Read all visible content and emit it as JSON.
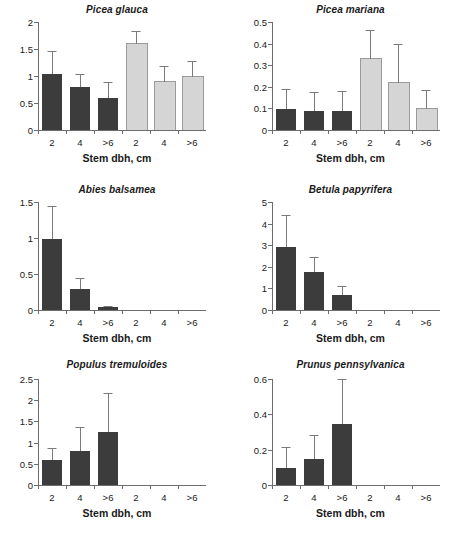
{
  "figure": {
    "xlabel": "Stem dbh, cm",
    "categories": [
      ">6",
      "4",
      "2"
    ],
    "caption_partial": "Results are presented by diameter (dbh) in three size classes. The dark bars are control plots and the light bars are treated plots."
  },
  "colors": {
    "dark_bar": "#3c3c3c",
    "light_bar": "#d5d5d5",
    "axis": "#6d6d6d",
    "error_bar": "#7a7a7a",
    "text": "#1a1a1a"
  },
  "chart_data": [
    {
      "type": "bar",
      "title": "Picea glauca",
      "xlabel": "Stem dbh, cm",
      "ylabel": "",
      "ylim": [
        0,
        2
      ],
      "yticks": [
        0,
        0.5,
        1,
        1.5,
        2
      ],
      "ytick_labels": [
        "0",
        "0.5",
        "1",
        "1.5",
        "2"
      ],
      "categories": [
        "2",
        "4",
        ">6",
        "2",
        "4",
        ">6"
      ],
      "groups": [
        "dark",
        "dark",
        "dark",
        "light",
        "light",
        "light"
      ],
      "values": [
        1.03,
        0.79,
        0.59,
        1.59,
        0.88,
        0.99
      ],
      "errors_upper": [
        1.46,
        1.03,
        0.89,
        1.84,
        1.18,
        1.28
      ],
      "grid": false,
      "legend": "none"
    },
    {
      "type": "bar",
      "title": "Picea mariana",
      "xlabel": "Stem dbh, cm",
      "ylabel": "",
      "ylim": [
        0,
        0.5
      ],
      "yticks": [
        0,
        0.1,
        0.2,
        0.3,
        0.4,
        0.5
      ],
      "ytick_labels": [
        "0",
        "0.1",
        "0.2",
        "0.3",
        "0.4",
        "0.5"
      ],
      "categories": [
        "2",
        "4",
        ">6",
        "2",
        "4",
        ">6"
      ],
      "groups": [
        "dark",
        "dark",
        "dark",
        "light",
        "light",
        "light"
      ],
      "values": [
        0.098,
        0.089,
        0.088,
        0.328,
        0.216,
        0.097
      ],
      "errors_upper": [
        0.188,
        0.178,
        0.182,
        0.462,
        0.399,
        0.185
      ],
      "grid": false,
      "legend": "none"
    },
    {
      "type": "bar",
      "title": "Abies balsamea",
      "xlabel": "Stem dbh, cm",
      "ylabel": "",
      "ylim": [
        0,
        1.5
      ],
      "yticks": [
        0,
        0.5,
        1,
        1.5
      ],
      "ytick_labels": [
        "0",
        "0.5",
        "1",
        "1.5"
      ],
      "categories": [
        "2",
        "4",
        ">6",
        "2",
        "4",
        ">6"
      ],
      "groups": [
        "dark",
        "dark",
        "dark",
        "light",
        "light",
        "light"
      ],
      "values": [
        0.99,
        0.29,
        0.035,
        0,
        0,
        0
      ],
      "errors_upper": [
        1.44,
        0.44,
        0.05,
        0,
        0,
        0
      ],
      "grid": false,
      "legend": "none"
    },
    {
      "type": "bar",
      "title": "Betula papyrifera",
      "xlabel": "Stem dbh, cm",
      "ylabel": "",
      "ylim": [
        0,
        5
      ],
      "yticks": [
        0,
        1,
        2,
        3,
        4,
        5
      ],
      "ytick_labels": [
        "0",
        "1",
        "2",
        "3",
        "4",
        "5"
      ],
      "categories": [
        "2",
        "4",
        ">6",
        "2",
        "4",
        ">6"
      ],
      "groups": [
        "dark",
        "dark",
        "dark",
        "light",
        "light",
        "light"
      ],
      "values": [
        2.93,
        1.78,
        0.71,
        0,
        0,
        0
      ],
      "errors_upper": [
        4.42,
        2.46,
        1.1,
        0,
        0,
        0
      ],
      "grid": false,
      "legend": "none"
    },
    {
      "type": "bar",
      "title": "Populus tremuloides",
      "xlabel": "Stem dbh, cm",
      "ylabel": "",
      "ylim": [
        0,
        2.5
      ],
      "yticks": [
        0,
        0.5,
        1,
        1.5,
        2,
        2.5
      ],
      "ytick_labels": [
        "0",
        "0.5",
        "1",
        "1.5",
        "2",
        "2.5"
      ],
      "categories": [
        "2",
        "4",
        ">6",
        "2",
        "4",
        ">6"
      ],
      "groups": [
        "dark",
        "dark",
        "dark",
        "light",
        "light",
        "light"
      ],
      "values": [
        0.6,
        0.8,
        1.25,
        0,
        0,
        0
      ],
      "errors_upper": [
        0.88,
        1.36,
        2.16,
        0,
        0,
        0
      ],
      "grid": false,
      "legend": "none"
    },
    {
      "type": "bar",
      "title": "Prunus pennsylvanica",
      "xlabel": "Stem dbh, cm",
      "ylabel": "",
      "ylim": [
        0,
        0.6
      ],
      "yticks": [
        0,
        0.2,
        0.4,
        0.6
      ],
      "ytick_labels": [
        "0",
        "0.2",
        "0.4",
        "0.6"
      ],
      "categories": [
        "2",
        "4",
        ">6",
        "2",
        "4",
        ">6"
      ],
      "groups": [
        "dark",
        "dark",
        "dark",
        "light",
        "light",
        "light"
      ],
      "values": [
        0.097,
        0.145,
        0.345,
        0,
        0,
        0
      ],
      "errors_upper": [
        0.216,
        0.285,
        0.6,
        0,
        0,
        0
      ],
      "grid": false,
      "legend": "none"
    }
  ]
}
